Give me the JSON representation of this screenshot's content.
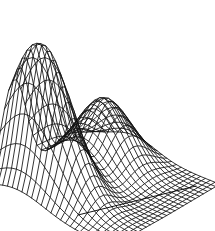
{
  "figure": {
    "title": "",
    "background_color": "#ffffff",
    "line_color": "#111111",
    "width": 215,
    "height": 231
  },
  "chart_data": {
    "type": "line",
    "plot_kind": "wireframe-surface-mesh-3d",
    "title": "",
    "subtitle": "",
    "xlabel": "",
    "ylabel": "",
    "zlabel": "",
    "grid": false,
    "legend": null,
    "legend_position": "none",
    "axes_visible": false,
    "tick_labels_visible": false,
    "annotations": [],
    "surface_function": "z = A1*exp(-((x-x1)^2/s1x + (y-y1)^2/s1y)) + A2*exp(-((x-x2)^2/s2x + (y-y2)^2/s2y))",
    "grid_divisions_u": 26,
    "grid_divisions_v": 26,
    "xlim": [
      -3,
      3
    ],
    "ylim": [
      -3,
      3
    ],
    "zlim": [
      0,
      1
    ],
    "peaks": [
      {
        "name": "primary-peak",
        "x": -1.55,
        "y": 1.75,
        "amplitude": 1.0,
        "sigma_x": 0.72,
        "sigma_y": 1.45
      },
      {
        "name": "secondary-ridge",
        "x": 1.35,
        "y": 1.15,
        "amplitude": 0.46,
        "sigma_x": 0.95,
        "sigma_y": 1.1
      }
    ],
    "projection": {
      "azimuth_deg": -52,
      "elevation_deg": 22,
      "z_scale": 150,
      "origin_x": 104,
      "origin_y": 191,
      "unit_x": 29.5,
      "unit_y": 20.5
    },
    "silhouette_points": {
      "apex": [
        76,
        12
      ],
      "left_corner": [
        14,
        134
      ],
      "bottom_corner": [
        78,
        215
      ],
      "right_corner": [
        196,
        186
      ],
      "right_tip": [
        183,
        150
      ]
    }
  }
}
